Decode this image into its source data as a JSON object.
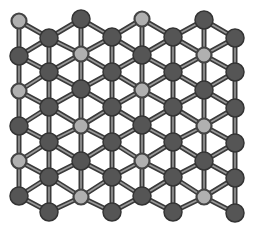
{
  "diagram": {
    "type": "atomic-lattice",
    "colors": {
      "background": "#ffffff",
      "dark_atom_fill": "#555555",
      "dark_atom_stroke": "#333333",
      "light_atom_fill": "#b0b0b0",
      "light_atom_stroke": "#444444",
      "bond_outer": "#3a3a3a",
      "bond_inner": "#9a9a9a"
    },
    "columns": [
      {
        "x": 19,
        "atoms": [
          {
            "y": 21,
            "t": "light"
          },
          {
            "y": 56,
            "t": "dark"
          },
          {
            "y": 91,
            "t": "light"
          },
          {
            "y": 126,
            "t": "dark"
          },
          {
            "y": 161,
            "t": "light"
          },
          {
            "y": 196,
            "t": "dark"
          }
        ]
      },
      {
        "x": 49,
        "atoms": [
          {
            "y": 38,
            "t": "dark"
          },
          {
            "y": 72,
            "t": "dark"
          },
          {
            "y": 107,
            "t": "dark"
          },
          {
            "y": 142,
            "t": "dark"
          },
          {
            "y": 177,
            "t": "dark"
          },
          {
            "y": 212,
            "t": "dark"
          }
        ]
      },
      {
        "x": 81,
        "atoms": [
          {
            "y": 19,
            "t": "dark"
          },
          {
            "y": 54,
            "t": "light"
          },
          {
            "y": 89,
            "t": "dark"
          },
          {
            "y": 126,
            "t": "light"
          },
          {
            "y": 161,
            "t": "dark"
          },
          {
            "y": 197,
            "t": "light"
          }
        ]
      },
      {
        "x": 112,
        "atoms": [
          {
            "y": 37,
            "t": "dark"
          },
          {
            "y": 72,
            "t": "dark"
          },
          {
            "y": 107,
            "t": "dark"
          },
          {
            "y": 142,
            "t": "dark"
          },
          {
            "y": 177,
            "t": "dark"
          },
          {
            "y": 212,
            "t": "dark"
          }
        ]
      },
      {
        "x": 142,
        "atoms": [
          {
            "y": 19,
            "t": "light"
          },
          {
            "y": 55,
            "t": "dark"
          },
          {
            "y": 90,
            "t": "light"
          },
          {
            "y": 125,
            "t": "dark"
          },
          {
            "y": 161,
            "t": "light"
          },
          {
            "y": 196,
            "t": "dark"
          }
        ]
      },
      {
        "x": 173,
        "atoms": [
          {
            "y": 37,
            "t": "dark"
          },
          {
            "y": 72,
            "t": "dark"
          },
          {
            "y": 107,
            "t": "dark"
          },
          {
            "y": 142,
            "t": "dark"
          },
          {
            "y": 177,
            "t": "dark"
          },
          {
            "y": 212,
            "t": "dark"
          }
        ]
      },
      {
        "x": 204,
        "atoms": [
          {
            "y": 20,
            "t": "dark"
          },
          {
            "y": 55,
            "t": "light"
          },
          {
            "y": 90,
            "t": "dark"
          },
          {
            "y": 126,
            "t": "light"
          },
          {
            "y": 161,
            "t": "dark"
          },
          {
            "y": 197,
            "t": "light"
          }
        ]
      },
      {
        "x": 235,
        "atoms": [
          {
            "y": 38,
            "t": "dark"
          },
          {
            "y": 72,
            "t": "dark"
          },
          {
            "y": 108,
            "t": "dark"
          },
          {
            "y": 143,
            "t": "dark"
          },
          {
            "y": 178,
            "t": "dark"
          },
          {
            "y": 213,
            "t": "dark"
          }
        ]
      }
    ],
    "radii": {
      "dark": 9,
      "light": 7.5
    }
  }
}
